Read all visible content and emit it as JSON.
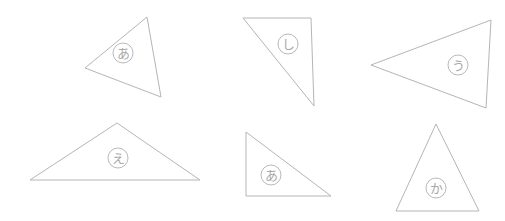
{
  "canvas": {
    "width": 505,
    "height": 221,
    "background_color": "#ffffff",
    "stroke_color": "#b5b5b5",
    "glyph_color": "#a9a9a9"
  },
  "shapes": [
    {
      "id": "triangle-1",
      "name": "triangle-scalene-upper-left",
      "points": "85,68 147,17 161,97",
      "label": {
        "character": "あ",
        "romaji": "a",
        "cx": 123,
        "cy": 53,
        "r": 10,
        "font_size": 13
      }
    },
    {
      "id": "triangle-2",
      "name": "triangle-right-upper-middle",
      "points": "243,18 311,18 314,106",
      "label": {
        "character": "し",
        "romaji": "shi",
        "cx": 288,
        "cy": 44,
        "r": 10,
        "font_size": 13
      }
    },
    {
      "id": "triangle-3",
      "name": "triangle-left-pointing-upper-right",
      "points": "371,65 491,20 486,108",
      "label": {
        "character": "う",
        "romaji": "u",
        "cx": 458,
        "cy": 65,
        "r": 10,
        "font_size": 13
      }
    },
    {
      "id": "triangle-4",
      "name": "triangle-wide-flat-lower-left",
      "points": "30,180 117,123 200,180",
      "label": {
        "character": "え",
        "romaji": "e",
        "cx": 118,
        "cy": 158,
        "r": 10,
        "font_size": 13
      }
    },
    {
      "id": "triangle-5",
      "name": "triangle-right-lower-middle",
      "points": "246,132 246,196 331,196",
      "label": {
        "character": "あ",
        "romaji": "a",
        "cx": 271,
        "cy": 175,
        "r": 10,
        "font_size": 13
      }
    },
    {
      "id": "triangle-6",
      "name": "triangle-isosceles-lower-right",
      "points": "436,124 396,211 479,211",
      "label": {
        "character": "か",
        "romaji": "ka",
        "cx": 436,
        "cy": 188,
        "r": 10,
        "font_size": 13
      }
    }
  ]
}
